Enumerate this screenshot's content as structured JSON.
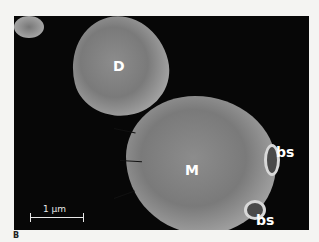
{
  "figure": {
    "panel_letter": "B",
    "labels": {
      "daughter": "D",
      "mother": "M",
      "bud_scar_1": "bs",
      "bud_scar_2": "bs"
    },
    "scale_bar": {
      "label": "1 μm"
    },
    "arrows_count": 3
  }
}
